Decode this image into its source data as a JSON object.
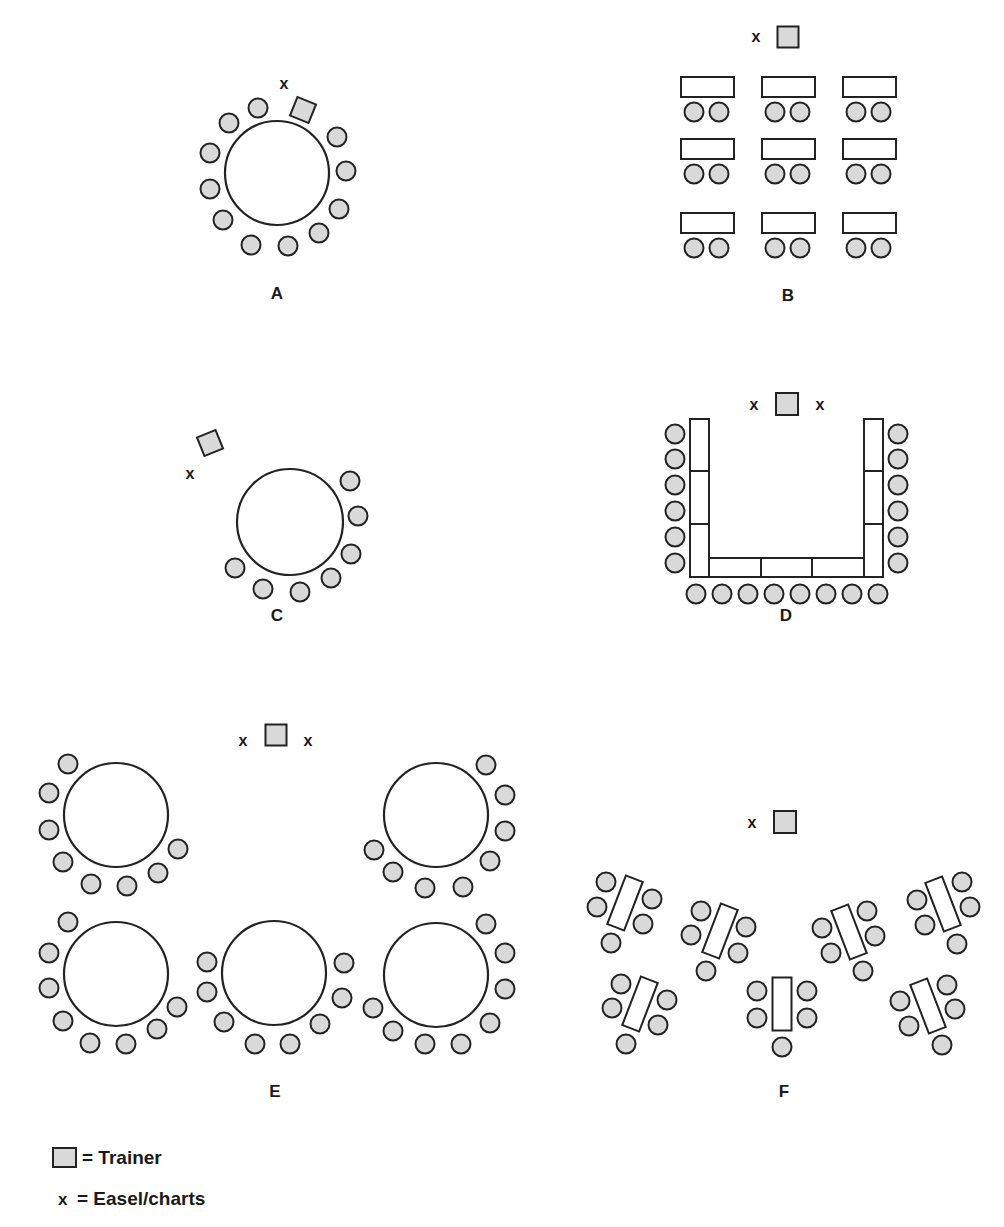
{
  "colors": {
    "chair_fill": "#d9d9d9",
    "trainer_fill": "#d9d9d9",
    "stroke": "#222222",
    "table_fill": "#ffffff"
  },
  "legend": {
    "trainer_label": "= Trainer",
    "easel_symbol": "x",
    "easel_label": "= Easel/charts"
  },
  "layouts": [
    {
      "id": "A",
      "label": "A",
      "label_pos": [
        277,
        295
      ],
      "round_tables": [
        {
          "cx": 277,
          "cy": 173,
          "r": 52
        }
      ],
      "rect_tables": [],
      "chairs": [
        [
          258,
          108
        ],
        [
          229,
          123
        ],
        [
          210,
          153
        ],
        [
          210,
          189
        ],
        [
          223,
          220
        ],
        [
          251,
          245
        ],
        [
          288,
          246
        ],
        [
          319,
          233
        ],
        [
          339,
          209
        ],
        [
          346,
          171
        ],
        [
          337,
          137
        ]
      ],
      "trainers": [
        {
          "cx": 303,
          "cy": 110,
          "size": 20,
          "rot": 22
        }
      ],
      "easels": [
        [
          284,
          85
        ]
      ]
    },
    {
      "id": "B",
      "label": "B",
      "label_pos": [
        788,
        297
      ],
      "round_tables": [],
      "rect_tables": [
        {
          "x": 681,
          "y": 77,
          "w": 53,
          "h": 20,
          "rot": 0
        },
        {
          "x": 762,
          "y": 77,
          "w": 53,
          "h": 20,
          "rot": 0
        },
        {
          "x": 843,
          "y": 77,
          "w": 53,
          "h": 20,
          "rot": 0
        },
        {
          "x": 681,
          "y": 139,
          "w": 53,
          "h": 20,
          "rot": 0
        },
        {
          "x": 762,
          "y": 139,
          "w": 53,
          "h": 20,
          "rot": 0
        },
        {
          "x": 843,
          "y": 139,
          "w": 53,
          "h": 20,
          "rot": 0
        },
        {
          "x": 681,
          "y": 213,
          "w": 53,
          "h": 20,
          "rot": 0
        },
        {
          "x": 762,
          "y": 213,
          "w": 53,
          "h": 20,
          "rot": 0
        },
        {
          "x": 843,
          "y": 213,
          "w": 53,
          "h": 20,
          "rot": 0
        }
      ],
      "chairs": [
        [
          694,
          112
        ],
        [
          719,
          112
        ],
        [
          775,
          112
        ],
        [
          800,
          112
        ],
        [
          856,
          112
        ],
        [
          881,
          112
        ],
        [
          694,
          174
        ],
        [
          719,
          174
        ],
        [
          775,
          174
        ],
        [
          800,
          174
        ],
        [
          856,
          174
        ],
        [
          881,
          174
        ],
        [
          694,
          248
        ],
        [
          719,
          248
        ],
        [
          775,
          248
        ],
        [
          800,
          248
        ],
        [
          856,
          248
        ],
        [
          881,
          248
        ]
      ],
      "trainers": [
        {
          "cx": 788,
          "cy": 37,
          "size": 21,
          "rot": 0
        }
      ],
      "easels": [
        [
          756,
          38
        ]
      ]
    },
    {
      "id": "C",
      "label": "C",
      "label_pos": [
        277,
        617
      ],
      "round_tables": [
        {
          "cx": 290,
          "cy": 522,
          "r": 53
        }
      ],
      "rect_tables": [],
      "chairs": [
        [
          350,
          481
        ],
        [
          358,
          516
        ],
        [
          351,
          554
        ],
        [
          331,
          578
        ],
        [
          300,
          592
        ],
        [
          263,
          589
        ],
        [
          235,
          568
        ]
      ],
      "trainers": [
        {
          "cx": 210,
          "cy": 443,
          "size": 20,
          "rot": -22
        }
      ],
      "easels": [
        [
          190,
          475
        ]
      ]
    },
    {
      "id": "D",
      "label": "D",
      "label_pos": [
        786,
        617
      ],
      "round_tables": [],
      "rect_tables": [
        {
          "x": 690,
          "y": 419,
          "w": 19,
          "h": 52,
          "rot": 0
        },
        {
          "x": 690,
          "y": 471,
          "w": 19,
          "h": 53,
          "rot": 0
        },
        {
          "x": 690,
          "y": 524,
          "w": 19,
          "h": 53,
          "rot": 0
        },
        {
          "x": 864,
          "y": 419,
          "w": 19,
          "h": 52,
          "rot": 0
        },
        {
          "x": 864,
          "y": 471,
          "w": 19,
          "h": 53,
          "rot": 0
        },
        {
          "x": 864,
          "y": 524,
          "w": 19,
          "h": 53,
          "rot": 0
        },
        {
          "x": 709,
          "y": 558,
          "w": 52,
          "h": 19,
          "rot": 0
        },
        {
          "x": 761,
          "y": 558,
          "w": 51,
          "h": 19,
          "rot": 0
        },
        {
          "x": 812,
          "y": 558,
          "w": 52,
          "h": 19,
          "rot": 0
        }
      ],
      "chairs": [
        [
          675,
          434
        ],
        [
          675,
          459
        ],
        [
          675,
          485
        ],
        [
          675,
          511
        ],
        [
          675,
          537
        ],
        [
          675,
          563
        ],
        [
          898,
          434
        ],
        [
          898,
          459
        ],
        [
          898,
          485
        ],
        [
          898,
          511
        ],
        [
          898,
          537
        ],
        [
          898,
          563
        ],
        [
          696,
          594
        ],
        [
          722,
          594
        ],
        [
          748,
          594
        ],
        [
          774,
          594
        ],
        [
          800,
          594
        ],
        [
          826,
          594
        ],
        [
          852,
          594
        ],
        [
          878,
          594
        ]
      ],
      "trainers": [
        {
          "cx": 787,
          "cy": 404,
          "size": 22,
          "rot": 0
        }
      ],
      "easels": [
        [
          754,
          406
        ],
        [
          820,
          406
        ]
      ]
    },
    {
      "id": "E",
      "label": "E",
      "label_pos": [
        275,
        1093
      ],
      "round_tables": [
        {
          "cx": 116,
          "cy": 815,
          "r": 52
        },
        {
          "cx": 436,
          "cy": 815,
          "r": 52
        },
        {
          "cx": 116,
          "cy": 974,
          "r": 52
        },
        {
          "cx": 274,
          "cy": 973,
          "r": 52
        },
        {
          "cx": 436,
          "cy": 975,
          "r": 52
        }
      ],
      "rect_tables": [],
      "chairs": [
        [
          68,
          764
        ],
        [
          49,
          793
        ],
        [
          49,
          830
        ],
        [
          63,
          862
        ],
        [
          91,
          884
        ],
        [
          127,
          886
        ],
        [
          158,
          873
        ],
        [
          178,
          849
        ],
        [
          486,
          765
        ],
        [
          505,
          795
        ],
        [
          505,
          831
        ],
        [
          490,
          861
        ],
        [
          463,
          887
        ],
        [
          425,
          888
        ],
        [
          393,
          872
        ],
        [
          374,
          850
        ],
        [
          68,
          922
        ],
        [
          49,
          953
        ],
        [
          49,
          988
        ],
        [
          63,
          1021
        ],
        [
          90,
          1043
        ],
        [
          126,
          1044
        ],
        [
          157,
          1029
        ],
        [
          177,
          1007
        ],
        [
          207,
          962
        ],
        [
          207,
          992
        ],
        [
          224,
          1022
        ],
        [
          255,
          1044
        ],
        [
          290,
          1044
        ],
        [
          320,
          1024
        ],
        [
          342,
          998
        ],
        [
          344,
          963
        ],
        [
          486,
          924
        ],
        [
          505,
          953
        ],
        [
          505,
          989
        ],
        [
          490,
          1023
        ],
        [
          461,
          1044
        ],
        [
          425,
          1044
        ],
        [
          393,
          1031
        ],
        [
          373,
          1008
        ]
      ],
      "trainers": [
        {
          "cx": 276,
          "cy": 735,
          "size": 21,
          "rot": 0
        }
      ],
      "easels": [
        [
          243,
          742
        ],
        [
          308,
          742
        ]
      ]
    },
    {
      "id": "F",
      "label": "F",
      "label_pos": [
        784,
        1093
      ],
      "round_tables": [],
      "rect_tables": [
        {
          "cx": 625,
          "cy": 903,
          "w": 18,
          "h": 52,
          "rot": 21
        },
        {
          "cx": 720,
          "cy": 931,
          "w": 18,
          "h": 52,
          "rot": 21
        },
        {
          "cx": 849,
          "cy": 932,
          "w": 18,
          "h": 52,
          "rot": -21
        },
        {
          "cx": 943,
          "cy": 904,
          "w": 18,
          "h": 52,
          "rot": -21
        },
        {
          "cx": 640,
          "cy": 1004,
          "w": 18,
          "h": 52,
          "rot": 21
        },
        {
          "cx": 782,
          "cy": 1004,
          "w": 19,
          "h": 53,
          "rot": 0
        },
        {
          "cx": 928,
          "cy": 1006,
          "w": 18,
          "h": 52,
          "rot": -21
        }
      ],
      "chairs": [
        [
          606,
          882
        ],
        [
          597,
          907
        ],
        [
          652,
          899
        ],
        [
          643,
          924
        ],
        [
          611,
          943
        ],
        [
          701,
          911
        ],
        [
          691,
          935
        ],
        [
          746,
          927
        ],
        [
          738,
          953
        ],
        [
          706,
          971
        ],
        [
          867,
          911
        ],
        [
          875,
          936
        ],
        [
          822,
          928
        ],
        [
          831,
          953
        ],
        [
          863,
          971
        ],
        [
          962,
          882
        ],
        [
          970,
          907
        ],
        [
          917,
          900
        ],
        [
          925,
          925
        ],
        [
          957,
          944
        ],
        [
          621,
          984
        ],
        [
          612,
          1008
        ],
        [
          667,
          1000
        ],
        [
          658,
          1025
        ],
        [
          626,
          1044
        ],
        [
          757,
          991
        ],
        [
          757,
          1018
        ],
        [
          807,
          991
        ],
        [
          807,
          1018
        ],
        [
          782,
          1047
        ],
        [
          947,
          985
        ],
        [
          955,
          1009
        ],
        [
          900,
          1001
        ],
        [
          909,
          1026
        ],
        [
          942,
          1045
        ]
      ],
      "trainers": [
        {
          "cx": 785,
          "cy": 822,
          "size": 22,
          "rot": 0
        }
      ],
      "easels": [
        [
          752,
          824
        ]
      ]
    }
  ]
}
